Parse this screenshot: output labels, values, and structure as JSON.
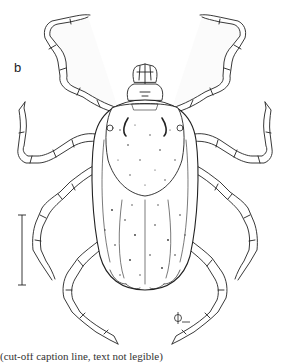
{
  "figure": {
    "panel_label": "b",
    "scale_bar": {
      "orientation": "vertical",
      "label": ""
    },
    "artist_monogram": "monogram",
    "caption_partial": "(cut-off caption line, text not legible)"
  },
  "colors": {
    "ink": "#222222",
    "background": "#ffffff",
    "stipple": "#333333"
  }
}
